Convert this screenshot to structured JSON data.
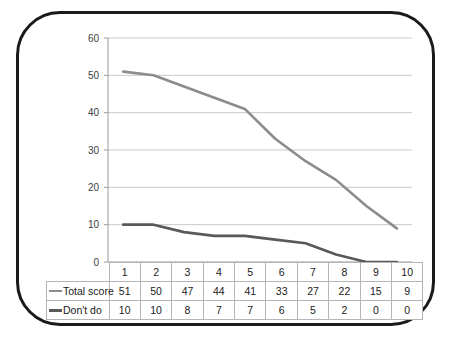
{
  "chart_data": {
    "type": "line",
    "title": "",
    "xlabel": "",
    "ylabel": "",
    "categories": [
      "1",
      "2",
      "3",
      "4",
      "5",
      "6",
      "7",
      "8",
      "9",
      "10"
    ],
    "ylim": [
      0,
      60
    ],
    "ytick_labels": [
      "0",
      "10",
      "20",
      "30",
      "40",
      "50",
      "60"
    ],
    "grid": true,
    "legend_position": "table-row-headers",
    "series": [
      {
        "name": "Total score",
        "color": "#8c8c8c",
        "values": [
          51,
          50,
          47,
          44,
          41,
          33,
          27,
          22,
          15,
          9
        ]
      },
      {
        "name": "Don't do",
        "color": "#595959",
        "values": [
          10,
          10,
          8,
          7,
          7,
          6,
          5,
          2,
          0,
          0
        ]
      }
    ]
  },
  "axis": {
    "ticks": [
      "60",
      "50",
      "40",
      "30",
      "20",
      "10",
      "0"
    ]
  },
  "table": {
    "corner_label": "",
    "column_headers": [
      "1",
      "2",
      "3",
      "4",
      "5",
      "6",
      "7",
      "8",
      "9",
      "10"
    ],
    "rows": [
      {
        "label": "Total score",
        "color": "#8c8c8c",
        "values": [
          "51",
          "50",
          "47",
          "44",
          "41",
          "33",
          "27",
          "22",
          "15",
          "9"
        ]
      },
      {
        "label": "Don't do",
        "color": "#595959",
        "values": [
          "10",
          "10",
          "8",
          "7",
          "7",
          "6",
          "5",
          "2",
          "0",
          "0"
        ]
      }
    ]
  },
  "colors": {
    "frame": "#1a1a1a",
    "grid": "#c9c9c9",
    "axis": "#9a9a9a",
    "text": "#404040",
    "series_total_score": "#8c8c8c",
    "series_dont_do": "#595959"
  }
}
